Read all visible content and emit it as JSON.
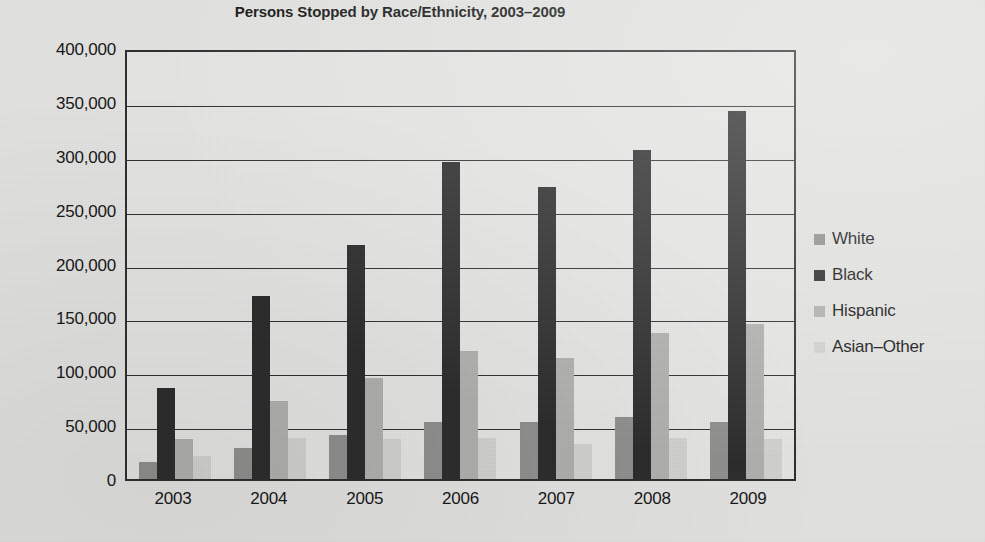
{
  "chart_data": {
    "type": "bar",
    "title": "Persons Stopped by Race/Ethnicity, 2003–2009",
    "xlabel": "",
    "ylabel": "",
    "categories": [
      "2003",
      "2004",
      "2005",
      "2006",
      "2007",
      "2008",
      "2009"
    ],
    "series": [
      {
        "name": "White",
        "color": "#8f8f8d",
        "values": [
          16000,
          29000,
          41000,
          53000,
          53000,
          58000,
          53000
        ]
      },
      {
        "name": "Black",
        "color": "#2b2b2b",
        "values": [
          85000,
          171000,
          218000,
          296000,
          272000,
          307000,
          343000
        ]
      },
      {
        "name": "Hispanic",
        "color": "#b0b0ae",
        "values": [
          37000,
          73000,
          94000,
          119000,
          113000,
          136000,
          145000
        ]
      },
      {
        "name": "Asian–Other",
        "color": "#d2d2d0",
        "values": [
          21000,
          38000,
          37000,
          38000,
          33000,
          38000,
          37000
        ]
      }
    ],
    "ylim": [
      0,
      400000
    ],
    "ytick_labels": [
      "400,000",
      "350,000",
      "300,000",
      "250,000",
      "200,000",
      "150,000",
      "100,000",
      "50,000",
      "0"
    ],
    "ytick_values": [
      400000,
      350000,
      300000,
      250000,
      200000,
      150000,
      100000,
      50000,
      0
    ],
    "grid": true,
    "legend_position": "right",
    "legend_entries": [
      "White",
      "Black",
      "Hispanic",
      "Asian–Other"
    ]
  },
  "colors": {
    "background": "#e3e3e1",
    "plot_background": "#e6e6e4",
    "axis": "#2d2d2d",
    "text": "#161616"
  }
}
